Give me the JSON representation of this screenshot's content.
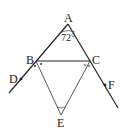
{
  "diagram": {
    "type": "geometry",
    "points": {
      "A": {
        "label": "A"
      },
      "B": {
        "label": "B"
      },
      "C": {
        "label": "C"
      },
      "D": {
        "label": "D"
      },
      "E": {
        "label": "E"
      },
      "F": {
        "label": "F"
      }
    },
    "angle_A": "72°",
    "segments": [
      "AB",
      "AC",
      "BC",
      "BE",
      "CE"
    ],
    "rays": [
      "AD (through B)",
      "AF (through C)"
    ],
    "markings": {
      "B": "two dots marking equal angles (BE bisects angle)",
      "C": "two small circles marking equal angles (CE bisects angle)"
    },
    "colors": {
      "line": "#222222",
      "background": "#ffffff"
    }
  }
}
